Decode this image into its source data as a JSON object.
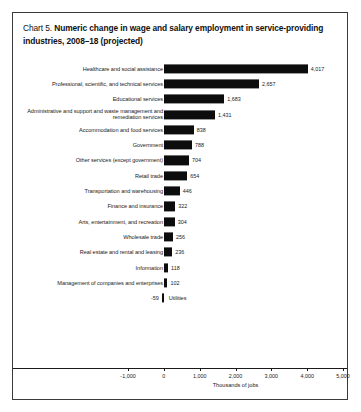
{
  "panel": {
    "title_number": "Chart 5.",
    "title_text": "Numeric change in wage and salary employment in service-providing industries, 2008–18 (projected)"
  },
  "chart_data": {
    "type": "bar",
    "orientation": "horizontal",
    "title": "Chart 5. Numeric change in wage and salary employment in service-providing industries, 2008–18 (projected)",
    "xlabel": "Thousands of jobs",
    "ylabel": "",
    "xlim": [
      -1000,
      5000
    ],
    "grid": false,
    "legend": "none",
    "xticks": [
      -1000,
      0,
      1000,
      2000,
      3000,
      4000,
      5000
    ],
    "xtick_labels": [
      "-1,000",
      "0",
      "1,000",
      "2,000",
      "3,000",
      "4,000",
      "5,000"
    ],
    "bar_color": "#0d0d0d",
    "categories": [
      "Healthcare and social assistance",
      "Professional, scientific, and technical services",
      "Educational services",
      "Administrative and support and waste management and remediation services",
      "Accommodation and food services",
      "Government",
      "Other services (except government)",
      "Retail trade",
      "Transportation and warehousing",
      "Finance and insurance",
      "Arts, entertainment, and recreation",
      "Wholesale trade",
      "Real estate and rental and leasing",
      "Information",
      "Management of companies and enterprises",
      "Utilities"
    ],
    "values": [
      4017,
      2657,
      1683,
      1431,
      838,
      788,
      704,
      654,
      446,
      322,
      304,
      256,
      236,
      118,
      102,
      -59
    ],
    "value_labels": [
      "4,017",
      "2,657",
      "1,683",
      "1,431",
      "838",
      "788",
      "704",
      "654",
      "446",
      "322",
      "304",
      "256",
      "236",
      "118",
      "102",
      "-59"
    ]
  }
}
